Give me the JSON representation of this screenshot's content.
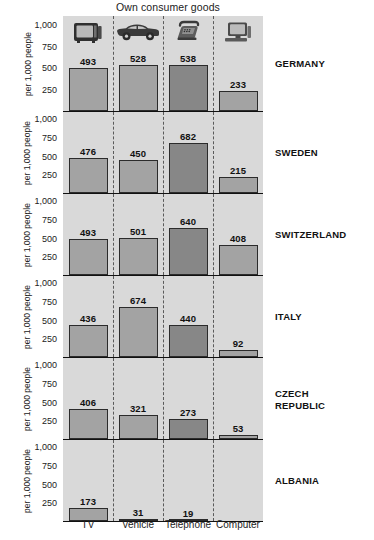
{
  "chart_data": {
    "type": "bar",
    "title": "Own consumer goods",
    "xlabel": "",
    "ylabel": "per 1,000 people",
    "ylim": [
      0,
      1100
    ],
    "grid": false,
    "legend": "none",
    "yticks": [
      "250",
      "500",
      "750",
      "1,000"
    ],
    "ytick_values": [
      250,
      500,
      750,
      1000
    ],
    "categories": [
      "TV",
      "Vehicle",
      "Telephone",
      "Computer"
    ],
    "category_icons": [
      "tv-icon",
      "car-icon",
      "telephone-icon",
      "computer-icon"
    ],
    "panels": [
      {
        "name": "GERMANY",
        "values": [
          493,
          528,
          538,
          233
        ],
        "labels": [
          "493",
          "528",
          "538",
          "233"
        ]
      },
      {
        "name": "SWEDEN",
        "values": [
          476,
          450,
          682,
          215
        ],
        "labels": [
          "476",
          "450",
          "682",
          "215"
        ]
      },
      {
        "name": "SWITZERLAND",
        "values": [
          493,
          501,
          640,
          408
        ],
        "labels": [
          "493",
          "501",
          "640",
          "408"
        ]
      },
      {
        "name": "ITALY",
        "values": [
          436,
          674,
          440,
          92
        ],
        "labels": [
          "436",
          "674",
          "440",
          "92"
        ]
      },
      {
        "name": "CZECH REPUBLIC",
        "name_line1": "CZECH",
        "name_line2": "REPUBLIC",
        "values": [
          406,
          321,
          273,
          53
        ],
        "labels": [
          "406",
          "321",
          "273",
          "53"
        ]
      },
      {
        "name": "ALBANIA",
        "values": [
          173,
          31,
          19,
          null
        ],
        "labels": [
          "173",
          "31",
          "19",
          ""
        ]
      }
    ],
    "colors": {
      "panel_background": "#d9d9d9",
      "bar_fill": "#a3a3a3",
      "bar_fill_telephone": "#878787",
      "bar_border": "#2b2b2b",
      "axis": "#111111",
      "divider": "#5a5a5a",
      "text": "#1a1a1a",
      "page_background": "#ffffff"
    }
  }
}
